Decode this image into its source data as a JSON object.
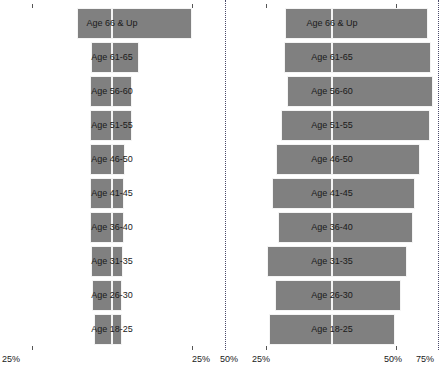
{
  "chart_data": [
    {
      "id": "chart-left",
      "type": "bar",
      "orientation": "horizontal-diverging",
      "title": "",
      "xlabel": "",
      "ylabel": "",
      "grid": false,
      "legend": "none",
      "categories": [
        "Age 66 & Up",
        "Age 61-65",
        "Age 56-60",
        "Age 51-55",
        "Age 46-50",
        "Age 41-45",
        "Age 36-40",
        "Age 31-35",
        "Age 26-30",
        "Age 18-25"
      ],
      "axis_ticks_left": [
        "25%"
      ],
      "axis_ticks_right": [
        "25%"
      ],
      "xlim_left": [
        25,
        0
      ],
      "xlim_right": [
        0,
        25
      ],
      "series": [
        {
          "name": "left",
          "side": "left",
          "values": [
            11.0,
            6.6,
            6.9,
            7.0,
            6.8,
            7.0,
            7.0,
            6.7,
            6.2,
            5.6
          ]
        },
        {
          "name": "right",
          "side": "right",
          "values": [
            25.0,
            8.3,
            6.4,
            6.2,
            4.0,
            3.8,
            3.6,
            3.4,
            3.2,
            3.1
          ]
        }
      ]
    },
    {
      "id": "chart-right",
      "type": "bar",
      "orientation": "horizontal-diverging",
      "title": "",
      "xlabel": "",
      "ylabel": "",
      "grid": false,
      "legend": "none",
      "categories": [
        "Age 66 & Up",
        "Age 61-65",
        "Age 56-60",
        "Age 51-55",
        "Age 46-50",
        "Age 41-45",
        "Age 36-40",
        "Age 31-35",
        "Age 26-30",
        "Age 18-25"
      ],
      "axis_ticks_left": [
        "50%",
        "25%"
      ],
      "axis_ticks_right": [
        "50%",
        "75%"
      ],
      "xlim_left": [
        50,
        0
      ],
      "xlim_right": [
        0,
        75
      ],
      "series": [
        {
          "name": "left",
          "side": "left",
          "values": [
            22.0,
            22.5,
            21.0,
            24.0,
            26.5,
            28.5,
            25.5,
            30.5,
            27.0,
            29.5
          ]
        },
        {
          "name": "right",
          "side": "right",
          "values": [
            68.0,
            70.0,
            71.5,
            69.0,
            62.5,
            58.5,
            57.5,
            53.0,
            49.0,
            44.5
          ]
        }
      ]
    }
  ],
  "colors": {
    "bar": "#808080",
    "bar_edge": "#f4f4f4",
    "dotted_line": "#4a4a6a",
    "text": "#1a1a1a",
    "background": "#ffffff"
  },
  "left_panel": {
    "axis_left_label": "25%",
    "axis_right_label": "25%"
  },
  "right_panel": {
    "axis_left_outer_label": "50%",
    "axis_left_inner_label": "25%",
    "axis_right_inner_label": "50%",
    "axis_right_outer_label": "75%"
  }
}
